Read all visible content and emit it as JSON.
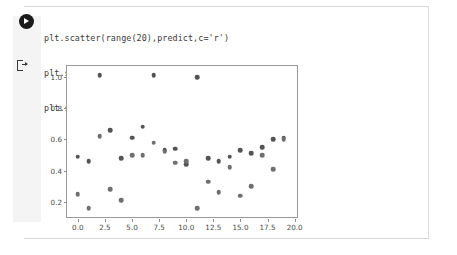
{
  "notebook": {
    "run_icon": "play-circle-icon",
    "output_icon": "output-prompt-icon",
    "code_lines": [
      "plt.scatter(range(20),predict,c='r')",
      "plt.scatter(range(20),y_test,c='g')",
      "plt.show()"
    ]
  },
  "colors": {
    "point": "#545454",
    "axis": "#9a9a9a",
    "tick_label": "#4a4a4a",
    "gutter": "#f4f4f4",
    "code_text": "#3b3b3b"
  },
  "chart_data": {
    "type": "scatter",
    "title": "",
    "xlabel": "",
    "ylabel": "",
    "xlim": [
      -1.0,
      20.4
    ],
    "ylim": [
      0.09,
      1.07
    ],
    "grid": false,
    "legend": null,
    "xticks": [
      "0.0",
      "2.5",
      "5.0",
      "7.5",
      "10.0",
      "12.5",
      "15.0",
      "17.5",
      "20.0"
    ],
    "xtick_values": [
      0.0,
      2.5,
      5.0,
      7.5,
      10.0,
      12.5,
      15.0,
      17.5,
      20.0
    ],
    "yticks": [
      "0.2",
      "0.4",
      "0.6",
      "0.8",
      "1.0"
    ],
    "ytick_values": [
      0.2,
      0.4,
      0.6,
      0.8,
      1.0
    ],
    "series": [
      {
        "name": "predict",
        "color": "#545454",
        "x": [
          0,
          1,
          2,
          3,
          4,
          5,
          6,
          7,
          8,
          9,
          10,
          11,
          12,
          13,
          14,
          15,
          16,
          17,
          18,
          19
        ],
        "values": [
          0.49,
          0.46,
          1.01,
          0.66,
          0.48,
          0.61,
          0.68,
          1.01,
          0.53,
          0.54,
          0.44,
          1.0,
          0.48,
          0.46,
          0.49,
          0.53,
          0.51,
          0.55,
          0.6,
          0.61
        ]
      },
      {
        "name": "y_test",
        "color": "#6f6f6f",
        "x": [
          0,
          1,
          2,
          3,
          4,
          5,
          6,
          7,
          8,
          9,
          10,
          11,
          12,
          13,
          14,
          15,
          16,
          17,
          18,
          19
        ],
        "values": [
          0.25,
          0.16,
          0.62,
          0.28,
          0.21,
          0.5,
          0.5,
          0.58,
          0.52,
          0.45,
          0.46,
          0.16,
          0.33,
          0.26,
          0.42,
          0.24,
          0.3,
          0.5,
          0.41,
          0.6
        ]
      }
    ]
  }
}
